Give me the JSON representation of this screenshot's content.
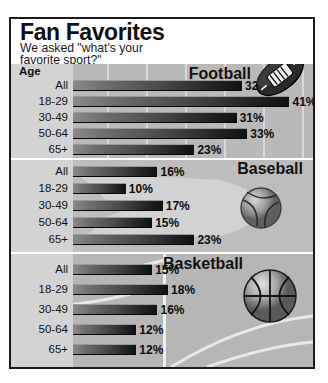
{
  "header": {
    "title": "Fan Favorites",
    "subtitle": "We asked \"what's your\nfavorite sport?\""
  },
  "labels": {
    "age_header": "Age"
  },
  "icons": {
    "football": "football-icon",
    "baseball": "baseball-icon",
    "basketball": "basketball-icon"
  },
  "chart_data": {
    "type": "bar",
    "title": "Fan Favorites",
    "subtitle": "We asked \"what's your favorite sport?\"",
    "xlabel": "",
    "ylabel": "Age",
    "xlim": [
      0,
      45
    ],
    "grid": true,
    "legend": "none",
    "categories": [
      "All",
      "18-29",
      "30-49",
      "50-64",
      "65+"
    ],
    "series": [
      {
        "name": "Football",
        "values": [
          32,
          41,
          31,
          33,
          23
        ],
        "labels": [
          "32%",
          "41%",
          "31%",
          "33%",
          "23%"
        ]
      },
      {
        "name": "Baseball",
        "values": [
          16,
          10,
          17,
          15,
          23
        ],
        "labels": [
          "16%",
          "10%",
          "17%",
          "15%",
          "23%"
        ]
      },
      {
        "name": "Basketball",
        "values": [
          15,
          18,
          16,
          12,
          12
        ],
        "labels": [
          "15%",
          "18%",
          "16%",
          "12%",
          "12%"
        ]
      }
    ]
  }
}
